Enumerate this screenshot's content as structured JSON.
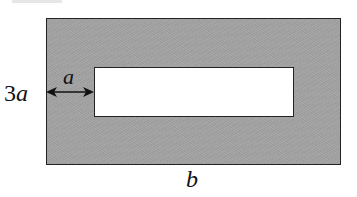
{
  "diagram": {
    "type": "geometry-figure",
    "labels": {
      "height": "3a",
      "height_coef": "3",
      "height_var": "a",
      "gap": "a",
      "width": "b"
    },
    "colors": {
      "shaded_fill": "#a2a2a2",
      "cutout_fill": "#ffffff",
      "stroke": "#222222"
    }
  }
}
